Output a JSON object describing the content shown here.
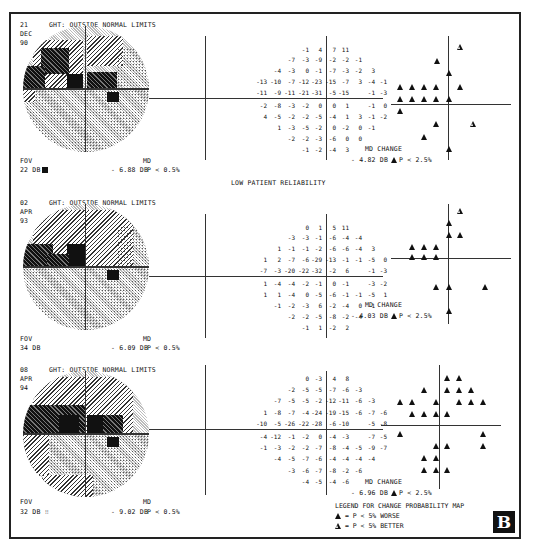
{
  "figure_label": "B",
  "reliability_note": "LOW PATIENT RELIABILITY",
  "panels": [
    {
      "date": {
        "day": "21",
        "month": "DEC",
        "year": "90"
      },
      "ght": "GHT: OUTSIDE NORMAL LIMITS",
      "fov_label": "FOV",
      "fov_value": "22 DB",
      "fov_symbol": "black-square",
      "md_label": "MD",
      "md_value": "- 6.88 DB",
      "md_p": "P < 0.5%",
      "md_change_label": "MD CHANGE",
      "md_change_value": "- 4.82 DB",
      "md_change_p": "P < 2.5%",
      "deviation_rows": [
        [
          "",
          "",
          "",
          "-1",
          "4",
          "7",
          "11",
          "",
          "",
          ""
        ],
        [
          "",
          "",
          "-7",
          "-3",
          "-9",
          "-2",
          "-2",
          "-1",
          "",
          ""
        ],
        [
          "",
          "-4",
          "-3",
          "0",
          "-1",
          "-7",
          "-3",
          "-2",
          "3",
          ""
        ],
        [
          "-13",
          "-10",
          "-7",
          "-12",
          "-23",
          "-15",
          "-7",
          "3",
          "-4",
          "-1"
        ],
        [
          "-11",
          "-9",
          "-11",
          "-21",
          "-31",
          "-5",
          "-15",
          "",
          "-1",
          "-3"
        ],
        [
          "-2",
          "-8",
          "-3",
          "-2",
          "0",
          "0",
          "1",
          "",
          "-1",
          "0"
        ],
        [
          "4",
          "-5",
          "-2",
          "-2",
          "-5",
          "-4",
          "1",
          "3",
          "-1",
          "-2"
        ],
        [
          "",
          "1",
          "-3",
          "-5",
          "-2",
          "0",
          "-2",
          "0",
          "-1",
          ""
        ],
        [
          "",
          "",
          "-2",
          "-2",
          "-3",
          "-6",
          "0",
          "0",
          "",
          ""
        ],
        [
          "",
          "",
          "",
          "-1",
          "-2",
          "-4",
          "3",
          "",
          "",
          ""
        ]
      ]
    },
    {
      "date": {
        "day": "02",
        "month": "APR",
        "year": "93"
      },
      "ght": "GHT: OUTSIDE NORMAL LIMITS",
      "fov_label": "FOV",
      "fov_value": "34 DB",
      "fov_symbol": "",
      "md_label": "MD",
      "md_value": "- 6.09 DB",
      "md_p": "P < 0.5%",
      "md_change_label": "MD CHANGE",
      "md_change_value": "- 4.03 DB",
      "md_change_p": "P < 2.5%",
      "deviation_rows": [
        [
          "",
          "",
          "",
          "0",
          "1",
          "5",
          "11",
          "",
          "",
          ""
        ],
        [
          "",
          "",
          "-3",
          "-3",
          "-1",
          "-6",
          "-4",
          "-4",
          "",
          ""
        ],
        [
          "",
          "1",
          "-1",
          "-1",
          "-2",
          "-6",
          "-6",
          "-4",
          "3",
          ""
        ],
        [
          "1",
          "2",
          "-7",
          "-6",
          "-29",
          "-13",
          "-1",
          "-1",
          "-5",
          "0"
        ],
        [
          "-7",
          "-3",
          "-20",
          "-22",
          "-32",
          "-2",
          "6",
          "",
          "-1",
          "-3"
        ],
        [
          "1",
          "-4",
          "-4",
          "-2",
          "-1",
          "0",
          "-1",
          "",
          "-3",
          "-2"
        ],
        [
          "1",
          "1",
          "-4",
          "0",
          "-5",
          "-6",
          "-1",
          "-1",
          "-5",
          "1"
        ],
        [
          "",
          "-1",
          "-2",
          "-3",
          "6",
          "-2",
          "-4",
          "0",
          "-1",
          ""
        ],
        [
          "",
          "",
          "-2",
          "-2",
          "-5",
          "-8",
          "-2",
          "-4",
          "",
          ""
        ],
        [
          "",
          "",
          "",
          "-1",
          "1",
          "-2",
          "2",
          "",
          "",
          ""
        ]
      ]
    },
    {
      "date": {
        "day": "08",
        "month": "APR",
        "year": "94"
      },
      "ght": "GHT: OUTSIDE NORMAL LIMITS",
      "fov_label": "FOV",
      "fov_value": "32 DB",
      "fov_symbol": "dots",
      "md_label": "MD",
      "md_value": "- 9.02 DB",
      "md_p": "P < 0.5%",
      "md_change_label": "MD CHANGE",
      "md_change_value": "- 6.96 DB",
      "md_change_p": "P < 2.5%",
      "deviation_rows": [
        [
          "",
          "",
          "",
          "0",
          "-3",
          "4",
          "8",
          "",
          "",
          ""
        ],
        [
          "",
          "",
          "-2",
          "-5",
          "-5",
          "-7",
          "-6",
          "-3",
          "",
          ""
        ],
        [
          "",
          "-7",
          "-5",
          "-5",
          "-2",
          "-12",
          "-11",
          "-6",
          "-3",
          ""
        ],
        [
          "1",
          "-8",
          "-7",
          "-4",
          "-24",
          "-19",
          "-15",
          "-6",
          "-7",
          "-6"
        ],
        [
          "-10",
          "-5",
          "-26",
          "-22",
          "-28",
          "-6",
          "-10",
          "",
          "-5",
          "-8"
        ],
        [
          "-4",
          "-12",
          "-1",
          "-2",
          "0",
          "-4",
          "-3",
          "",
          "-7",
          "-5"
        ],
        [
          "-1",
          "-3",
          "-2",
          "-2",
          "-7",
          "-8",
          "-4",
          "-5",
          "-9",
          "-7"
        ],
        [
          "",
          "-4",
          "-5",
          "-7",
          "-6",
          "-4",
          "-4",
          "-4",
          "-4",
          ""
        ],
        [
          "",
          "",
          "-3",
          "-6",
          "-7",
          "-8",
          "-2",
          "-6",
          "",
          ""
        ],
        [
          "",
          "",
          "",
          "-4",
          "-5",
          "-4",
          "-6",
          "",
          "",
          ""
        ]
      ]
    }
  ],
  "legend": {
    "title": "LEGEND FOR CHANGE PROBABILITY MAP",
    "worse": "= P < 5% WORSE",
    "better": "= P < 5% BETTER"
  }
}
